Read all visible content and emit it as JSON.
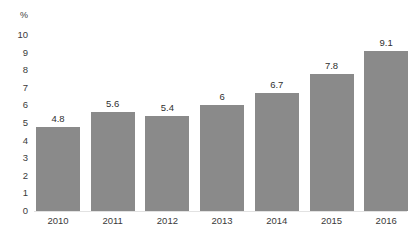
{
  "chart_data": {
    "type": "bar",
    "title": "",
    "subtitle": "",
    "xlabel": "",
    "ylabel": "",
    "unit_label": "%",
    "categories": [
      "2010",
      "2011",
      "2012",
      "2013",
      "2014",
      "2015",
      "2016"
    ],
    "values": [
      4.8,
      5.6,
      5.4,
      6,
      6.7,
      7.8,
      9.1
    ],
    "value_labels": [
      "4.8",
      "5.6",
      "5.4",
      "6",
      "6.7",
      "7.8",
      "9.1"
    ],
    "ylim": [
      0,
      10
    ],
    "ytick_labels": [
      "10",
      "9",
      "8",
      "7",
      "6",
      "5",
      "4",
      "3",
      "2",
      "1",
      "0"
    ],
    "ytick_values": [
      10,
      9,
      8,
      7,
      6,
      5,
      4,
      3,
      2,
      1,
      0
    ],
    "grid": false,
    "legend": false,
    "legend_position": "none",
    "bar_color": "#8a8a8a",
    "text_color": "#3a3a3a",
    "background_color": "#ffffff"
  }
}
